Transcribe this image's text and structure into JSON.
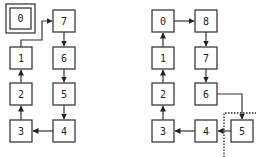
{
  "diagrams": [
    {
      "name": "left-cycle",
      "nodes": [
        {
          "label": "0",
          "x": 10,
          "y": 8,
          "highlighted": true
        },
        {
          "label": "7",
          "x": 53,
          "y": 10
        },
        {
          "label": "1",
          "x": 10,
          "y": 47
        },
        {
          "label": "6",
          "x": 53,
          "y": 47
        },
        {
          "label": "2",
          "x": 10,
          "y": 83
        },
        {
          "label": "5",
          "x": 53,
          "y": 83
        },
        {
          "label": "3",
          "x": 10,
          "y": 120
        },
        {
          "label": "4",
          "x": 53,
          "y": 120
        }
      ],
      "edges": [
        [
          "0",
          "7"
        ],
        [
          "7",
          "6"
        ],
        [
          "6",
          "5"
        ],
        [
          "5",
          "4"
        ],
        [
          "4",
          "3"
        ],
        [
          "3",
          "2"
        ],
        [
          "2",
          "1"
        ],
        [
          "1",
          "7"
        ]
      ]
    },
    {
      "name": "right-cycle",
      "nodes": [
        {
          "label": "0",
          "x": 152,
          "y": 10
        },
        {
          "label": "8",
          "x": 195,
          "y": 10
        },
        {
          "label": "1",
          "x": 152,
          "y": 47
        },
        {
          "label": "7",
          "x": 195,
          "y": 47
        },
        {
          "label": "2",
          "x": 152,
          "y": 83
        },
        {
          "label": "6",
          "x": 195,
          "y": 83
        },
        {
          "label": "3",
          "x": 152,
          "y": 120
        },
        {
          "label": "4",
          "x": 195,
          "y": 120
        },
        {
          "label": "5",
          "x": 231,
          "y": 120,
          "highlighted_region": true
        }
      ],
      "edges": [
        [
          "0",
          "8"
        ],
        [
          "8",
          "7"
        ],
        [
          "7",
          "6"
        ],
        [
          "6",
          "5"
        ],
        [
          "5",
          "4"
        ],
        [
          "4",
          "3"
        ],
        [
          "3",
          "2"
        ],
        [
          "2",
          "1"
        ],
        [
          "1",
          "0"
        ]
      ]
    }
  ]
}
